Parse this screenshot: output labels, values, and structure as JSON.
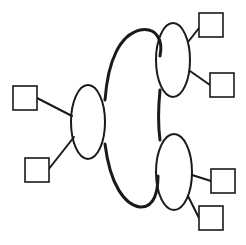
{
  "diagram": {
    "type": "network-cloud",
    "colors": {
      "stroke": "#1a1a1a",
      "fill": "#ffffff",
      "background": "#ffffff"
    },
    "cloud": {
      "lobes": [
        {
          "id": "left-lobe",
          "cx": 88,
          "cy": 122,
          "rx": 17,
          "ry": 37
        },
        {
          "id": "top-right-lobe",
          "cx": 173,
          "cy": 60,
          "rx": 17,
          "ry": 37
        },
        {
          "id": "bottom-right-lobe",
          "cx": 174,
          "cy": 172,
          "rx": 18,
          "ry": 38
        }
      ]
    },
    "nodes": [
      {
        "id": "left-node-1",
        "lobe": "left-lobe",
        "x": 13,
        "y": 86,
        "size": 24
      },
      {
        "id": "left-node-2",
        "lobe": "left-lobe",
        "x": 25,
        "y": 158,
        "size": 24
      },
      {
        "id": "top-right-node-1",
        "lobe": "top-right-lobe",
        "x": 199,
        "y": 13,
        "size": 24
      },
      {
        "id": "top-right-node-2",
        "lobe": "top-right-lobe",
        "x": 210,
        "y": 73,
        "size": 24
      },
      {
        "id": "bottom-right-node-1",
        "lobe": "bottom-right-lobe",
        "x": 211,
        "y": 169,
        "size": 24
      },
      {
        "id": "bottom-right-node-2",
        "lobe": "bottom-right-lobe",
        "x": 199,
        "y": 206,
        "size": 24
      }
    ]
  }
}
